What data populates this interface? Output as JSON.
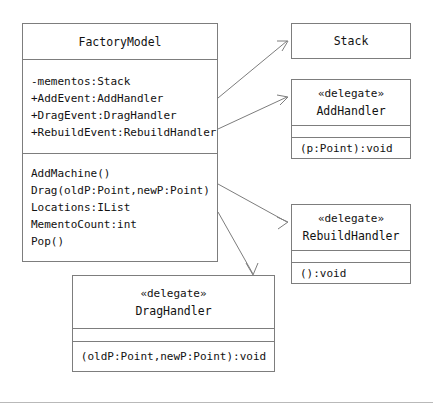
{
  "diagram": {
    "type": "uml-class-diagram",
    "background_color": "#ffffff",
    "line_color": "#7d7d7d",
    "text_color": "#111111"
  },
  "classes": {
    "factory_model": {
      "name": "FactoryModel",
      "attributes": [
        "-mementos:Stack",
        "+AddEvent:AddHandler",
        "+DragEvent:DragHandler",
        "+RebuildEvent:RebuildHandler"
      ],
      "operations": [
        "AddMachine()",
        "Drag(oldP:Point,newP:Point)",
        "Locations:IList",
        "MementoCount:int",
        "Pop()"
      ]
    },
    "stack": {
      "name": "Stack"
    },
    "add_handler": {
      "stereotype": "«delegate»",
      "name": "AddHandler",
      "signature": "(p:Point):void"
    },
    "rebuild_handler": {
      "stereotype": "«delegate»",
      "name": "RebuildHandler",
      "signature": "():void"
    },
    "drag_handler": {
      "stereotype": "«delegate»",
      "name": "DragHandler",
      "signature": "(oldP:Point,newP:Point):void"
    }
  },
  "edges": [
    {
      "name": "factorymodel-to-stack",
      "from": "factory_model",
      "to": "stack"
    },
    {
      "name": "factorymodel-to-addhandler",
      "from": "factory_model",
      "to": "add_handler"
    },
    {
      "name": "factorymodel-to-rebuildhandler",
      "from": "factory_model",
      "to": "rebuild_handler"
    },
    {
      "name": "factorymodel-to-draghandler",
      "from": "factory_model",
      "to": "drag_handler"
    }
  ]
}
